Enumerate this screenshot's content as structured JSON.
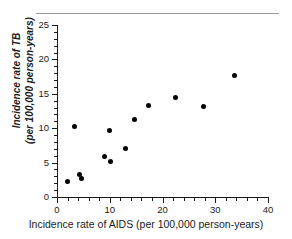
{
  "figure": {
    "name": "scatter-plot-tb-vs-aids",
    "has_top_rule": true,
    "marker_color": "#000000",
    "axis_color": "#1a1a1a",
    "background_color": "#ffffff"
  },
  "chart_data": {
    "type": "scatter",
    "title": "",
    "xlabel": "Incidence rate of AIDS (per 100,000 person-years)",
    "ylabel_line1": "Incidence rate of TB",
    "ylabel_line2": "(per 100,000 person-years)",
    "xlim": [
      0,
      40
    ],
    "ylim": [
      0,
      25
    ],
    "x_major_ticks": [
      0,
      10,
      20,
      30,
      40
    ],
    "x_minor_step": 2,
    "y_major_ticks": [
      0,
      5,
      10,
      15,
      20,
      25
    ],
    "y_minor_step": 1,
    "x_tick_labels": [
      "0",
      "10",
      "20",
      "30",
      "40"
    ],
    "y_tick_labels": [
      "0",
      "5",
      "10",
      "15",
      "20",
      "25"
    ],
    "grid": false,
    "legend": null,
    "marker": "filled-circle",
    "n_points": 13,
    "points": [
      {
        "x": 2.0,
        "y": 2.3
      },
      {
        "x": 3.3,
        "y": 10.3
      },
      {
        "x": 4.3,
        "y": 3.2
      },
      {
        "x": 4.7,
        "y": 2.7
      },
      {
        "x": 9.0,
        "y": 5.9
      },
      {
        "x": 10.0,
        "y": 9.6
      },
      {
        "x": 10.2,
        "y": 5.2
      },
      {
        "x": 13.0,
        "y": 7.0
      },
      {
        "x": 14.7,
        "y": 11.2
      },
      {
        "x": 17.3,
        "y": 13.3
      },
      {
        "x": 22.5,
        "y": 14.4
      },
      {
        "x": 27.7,
        "y": 13.2
      },
      {
        "x": 33.7,
        "y": 17.6
      }
    ]
  }
}
